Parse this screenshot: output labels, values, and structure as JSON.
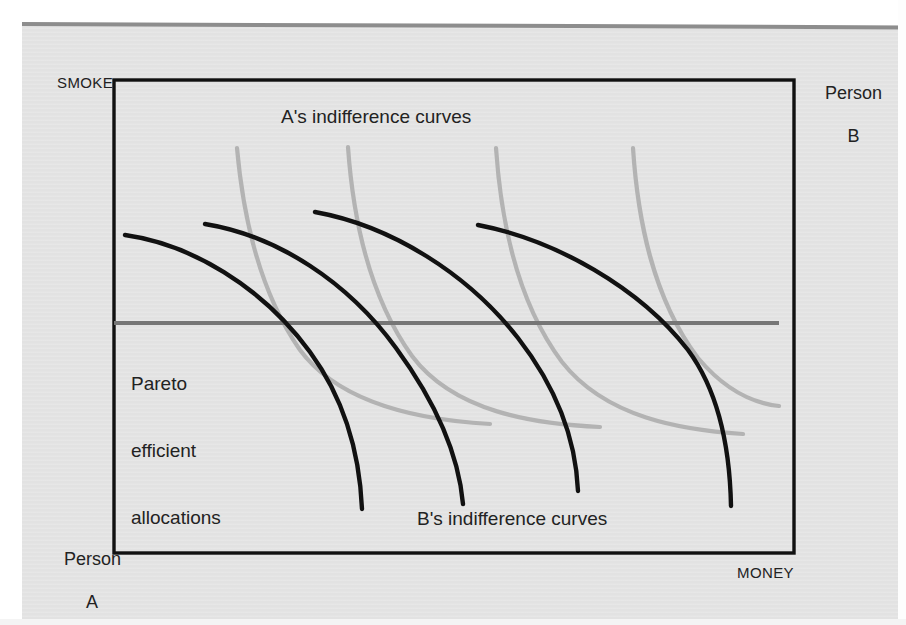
{
  "figure": {
    "type": "edgeworth-box-diagram",
    "axis_labels": {
      "y_top_left": "SMOKE",
      "x_bottom_right": "MONEY"
    },
    "corner_labels": {
      "origin_a_line1": "Person",
      "origin_a_line2": "A",
      "origin_b_line1": "Person",
      "origin_b_line2": "B"
    },
    "annotations": {
      "a_curves": "A's indifference curves",
      "b_curves": "B's indifference curves",
      "pareto_line1": "Pareto",
      "pareto_line2": "efficient",
      "pareto_line3": "allocations"
    },
    "colors": {
      "box_border": "#111111",
      "a_curve": "#b3b3b3",
      "b_curve": "#111111",
      "pareto_line": "#767676",
      "page_background": "#e3e3e3",
      "top_rule": "#8d8d8d",
      "text": "#222222"
    }
  },
  "chart_data": {
    "type": "line",
    "title": "",
    "xlabel": "MONEY",
    "ylabel": "SMOKE",
    "grid": false,
    "legend_position": "inline-annotations",
    "box": {
      "x0": 114,
      "y0": 80,
      "x1": 794,
      "y1": 553
    },
    "series": [
      {
        "name": "A's indifference curve 1",
        "color": "#b3b3b3",
        "path": "M 237,148 C 243,215 258,290 300,350 C 340,404 420,420 490,424"
      },
      {
        "name": "A's indifference curve 2",
        "color": "#b3b3b3",
        "path": "M 348,147 C 353,218 368,295 412,356 C 454,412 534,424 600,427"
      },
      {
        "name": "A's indifference curve 3",
        "color": "#b3b3b3",
        "path": "M 496,148 C 501,222 517,302 562,362 C 606,418 682,430 743,434"
      },
      {
        "name": "A's indifference curve 4",
        "color": "#b3b3b3",
        "path": "M 633,148 C 638,224 654,300 698,358 C 730,396 760,404 779,406"
      },
      {
        "name": "B's indifference curve 1",
        "color": "#111111",
        "path": "M 125,235 C 190,244 262,286 310,352 C 348,404 360,462 362,509"
      },
      {
        "name": "B's indifference curve 2",
        "color": "#111111",
        "path": "M 205,224 C 278,236 348,282 396,348 C 440,408 459,458 463,504"
      },
      {
        "name": "B's indifference curve 3",
        "color": "#111111",
        "path": "M 315,212 C 392,226 468,274 518,338 C 560,392 576,444 578,491"
      },
      {
        "name": "B's indifference curve 4",
        "color": "#111111",
        "path": "M 478,225 C 556,240 640,288 688,350 C 722,396 730,456 731,506"
      },
      {
        "name": "Pareto efficient allocations locus",
        "color": "#767676",
        "path": "M 114,323 L 779,323"
      }
    ]
  }
}
